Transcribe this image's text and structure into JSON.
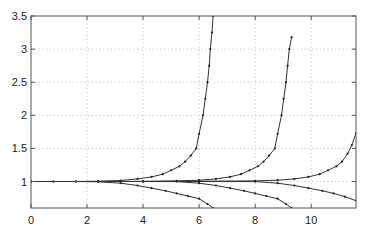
{
  "chart_data": {
    "type": "line",
    "title": "",
    "xlabel": "",
    "ylabel": "",
    "xlim": [
      0,
      11.6
    ],
    "ylim": [
      0.6,
      3.5
    ],
    "grid": true,
    "legend": null,
    "x_ticks": [
      0,
      2,
      4,
      6,
      8,
      10
    ],
    "x_tick_labels": [
      "0",
      "2",
      "4",
      "6",
      "8",
      "10"
    ],
    "y_ticks": [
      1,
      1.5,
      2,
      2.5,
      3,
      3.5
    ],
    "y_tick_labels": [
      "1",
      "1.5",
      "2",
      "2.5",
      "3",
      "3.5"
    ],
    "series": [
      {
        "name": "upper-1",
        "points": [
          [
            0,
            1.0
          ],
          [
            0.8,
            1.0
          ],
          [
            1.6,
            1.0
          ],
          [
            2.4,
            1.005
          ],
          [
            3.2,
            1.015
          ],
          [
            3.8,
            1.04
          ],
          [
            4.3,
            1.07
          ],
          [
            4.7,
            1.11
          ],
          [
            5.0,
            1.17
          ],
          [
            5.3,
            1.23
          ],
          [
            5.5,
            1.3
          ],
          [
            5.7,
            1.39
          ],
          [
            5.9,
            1.5
          ],
          [
            6.0,
            1.72
          ],
          [
            6.14,
            2.0
          ],
          [
            6.22,
            2.25
          ],
          [
            6.3,
            2.5
          ],
          [
            6.36,
            2.75
          ],
          [
            6.4,
            3.0
          ],
          [
            6.46,
            3.25
          ],
          [
            6.5,
            3.5
          ]
        ]
      },
      {
        "name": "upper-2",
        "points": [
          [
            0,
            1.0
          ],
          [
            2.4,
            1.0
          ],
          [
            4.0,
            1.003
          ],
          [
            5.2,
            1.01
          ],
          [
            6.0,
            1.02
          ],
          [
            6.6,
            1.04
          ],
          [
            7.1,
            1.07
          ],
          [
            7.5,
            1.11
          ],
          [
            7.8,
            1.17
          ],
          [
            8.1,
            1.23
          ],
          [
            8.3,
            1.3
          ],
          [
            8.5,
            1.39
          ],
          [
            8.7,
            1.5
          ],
          [
            8.8,
            1.72
          ],
          [
            8.94,
            2.0
          ],
          [
            9.02,
            2.25
          ],
          [
            9.1,
            2.5
          ],
          [
            9.16,
            2.75
          ],
          [
            9.22,
            3.0
          ],
          [
            9.3,
            3.18
          ]
        ]
      },
      {
        "name": "upper-3",
        "points": [
          [
            0,
            1.0
          ],
          [
            4.0,
            1.0
          ],
          [
            6.0,
            1.005
          ],
          [
            8.0,
            1.01
          ],
          [
            8.8,
            1.02
          ],
          [
            9.4,
            1.04
          ],
          [
            9.9,
            1.07
          ],
          [
            10.3,
            1.11
          ],
          [
            10.6,
            1.17
          ],
          [
            10.9,
            1.23
          ],
          [
            11.1,
            1.3
          ],
          [
            11.3,
            1.42
          ],
          [
            11.45,
            1.55
          ],
          [
            11.6,
            1.73
          ]
        ]
      },
      {
        "name": "lower-1",
        "points": [
          [
            0,
            1.0
          ],
          [
            0.8,
            1.0
          ],
          [
            1.6,
            1.0
          ],
          [
            2.4,
            0.995
          ],
          [
            3.2,
            0.975
          ],
          [
            3.8,
            0.94
          ],
          [
            4.3,
            0.9
          ],
          [
            4.8,
            0.86
          ],
          [
            5.2,
            0.82
          ],
          [
            5.6,
            0.78
          ],
          [
            6.0,
            0.74
          ],
          [
            6.3,
            0.66
          ],
          [
            6.5,
            0.6
          ]
        ]
      },
      {
        "name": "lower-2",
        "points": [
          [
            0,
            1.0
          ],
          [
            4.0,
            1.0
          ],
          [
            5.2,
            0.998
          ],
          [
            6.0,
            0.975
          ],
          [
            6.6,
            0.94
          ],
          [
            7.1,
            0.9
          ],
          [
            7.6,
            0.86
          ],
          [
            8.0,
            0.82
          ],
          [
            8.4,
            0.78
          ],
          [
            8.8,
            0.74
          ],
          [
            9.1,
            0.66
          ],
          [
            9.3,
            0.6
          ]
        ]
      },
      {
        "name": "lower-3",
        "points": [
          [
            0,
            1.0
          ],
          [
            6.0,
            1.0
          ],
          [
            8.0,
            0.998
          ],
          [
            8.8,
            0.975
          ],
          [
            9.4,
            0.94
          ],
          [
            9.9,
            0.9
          ],
          [
            10.4,
            0.86
          ],
          [
            10.8,
            0.82
          ],
          [
            11.2,
            0.77
          ],
          [
            11.6,
            0.71
          ]
        ]
      }
    ]
  }
}
